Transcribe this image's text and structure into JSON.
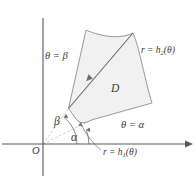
{
  "figure": {
    "origin_label": "O",
    "region_label": "D",
    "labels": {
      "theta_beta": "θ = β",
      "theta_alpha": "θ = α",
      "angle_beta": "β",
      "angle_alpha": "α",
      "r_h2_prefix": "r = h",
      "r_h2_sub": "2",
      "r_h2_suffix": "(θ)",
      "r_h1_prefix": "r = h",
      "r_h1_sub": "1",
      "r_h1_suffix": "(θ)"
    },
    "colors": {
      "axis": "#58585a",
      "outline": "#8d8d8f",
      "ray": "#6b6b6d",
      "fill": "#f1f1f1",
      "text": "#3c3c3c",
      "background": "#ffffff"
    },
    "geometry": {
      "origin": [
        43,
        144
      ],
      "x_axis": {
        "x1": 2,
        "y1": 144,
        "x2": 192,
        "y2": 144
      },
      "y_axis": {
        "x1": 43,
        "y1": 18,
        "x2": 43,
        "y2": 176
      },
      "ray_beta_end": [
        86,
        30
      ],
      "ray_alpha_end": [
        152,
        103
      ],
      "mid_ray_end": [
        133,
        33
      ],
      "arc_beta_radius": 34,
      "arc_alpha_radius": 46
    }
  }
}
